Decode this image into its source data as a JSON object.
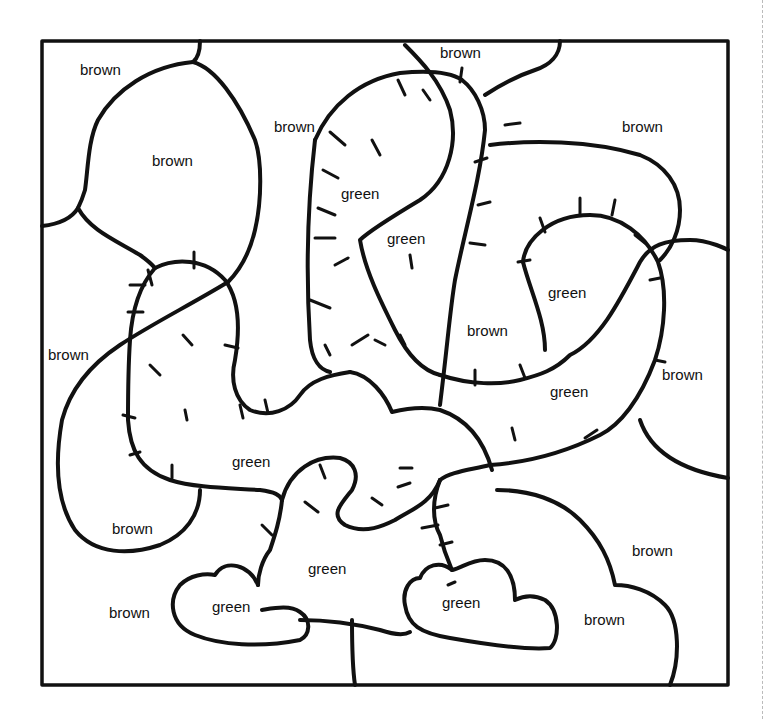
{
  "sheet": {
    "type": "color-by-word coloring page",
    "colors": {
      "brown": "#8B5A2B",
      "green": "#3A8A3A",
      "outline": "#111111"
    },
    "regions": [
      {
        "id": "r1",
        "label": "brown",
        "x": 80,
        "y": 62
      },
      {
        "id": "r2",
        "label": "brown",
        "x": 152,
        "y": 153
      },
      {
        "id": "r3",
        "label": "brown",
        "x": 274,
        "y": 119
      },
      {
        "id": "r4",
        "label": "brown",
        "x": 440,
        "y": 45
      },
      {
        "id": "r5",
        "label": "brown",
        "x": 622,
        "y": 119
      },
      {
        "id": "r6",
        "label": "green",
        "x": 341,
        "y": 186
      },
      {
        "id": "r7",
        "label": "green",
        "x": 387,
        "y": 231
      },
      {
        "id": "r8",
        "label": "green",
        "x": 548,
        "y": 285
      },
      {
        "id": "r9",
        "label": "brown",
        "x": 467,
        "y": 323
      },
      {
        "id": "r10",
        "label": "brown",
        "x": 48,
        "y": 347
      },
      {
        "id": "r11",
        "label": "brown",
        "x": 662,
        "y": 367
      },
      {
        "id": "r12",
        "label": "green",
        "x": 550,
        "y": 384
      },
      {
        "id": "r13",
        "label": "green",
        "x": 232,
        "y": 454
      },
      {
        "id": "r14",
        "label": "brown",
        "x": 112,
        "y": 521
      },
      {
        "id": "r15",
        "label": "brown",
        "x": 632,
        "y": 543
      },
      {
        "id": "r16",
        "label": "green",
        "x": 308,
        "y": 561
      },
      {
        "id": "r17",
        "label": "brown",
        "x": 109,
        "y": 605
      },
      {
        "id": "r18",
        "label": "green",
        "x": 212,
        "y": 599
      },
      {
        "id": "r19",
        "label": "green",
        "x": 442,
        "y": 595
      },
      {
        "id": "r20",
        "label": "brown",
        "x": 584,
        "y": 612
      }
    ]
  }
}
